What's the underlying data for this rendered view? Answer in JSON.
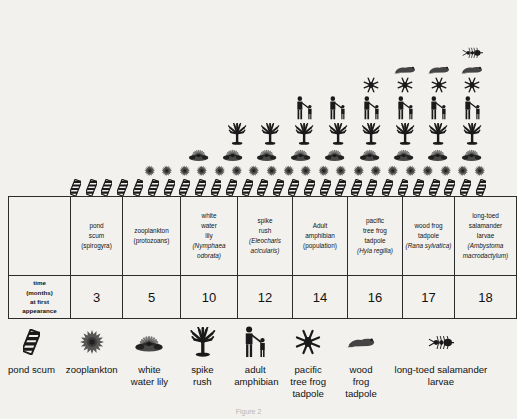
{
  "figure": {
    "caption": "Figure 2",
    "background_color": "#f2f1ee",
    "ink_color": "#1a1a1a"
  },
  "table": {
    "row_label": {
      "line1": "time",
      "line2": "(months)",
      "line3": "at first",
      "line4": "appearance"
    },
    "columns": [
      {
        "key": "pond-scum",
        "common_lines": [
          "pond",
          "scum"
        ],
        "scientific": "(spirogyra)",
        "scientific_italic": false,
        "time_months": "3",
        "icon": "pond-scum-icon",
        "count": 27,
        "legend_label": "pond scum"
      },
      {
        "key": "zooplankton",
        "common_lines": [
          "zooplankton"
        ],
        "scientific": "(protozoans)",
        "scientific_italic": false,
        "time_months": "5",
        "icon": "zooplankton-icon",
        "count": 20,
        "legend_label": "zooplankton"
      },
      {
        "key": "white-water-lily",
        "common_lines": [
          "white",
          "water",
          "lily"
        ],
        "scientific": "(Nymphaea odorata)",
        "scientific_italic": true,
        "time_months": "10",
        "icon": "water-lily-icon",
        "count": 9,
        "legend_label": "white water lily"
      },
      {
        "key": "spike-rush",
        "common_lines": [
          "spike",
          "rush"
        ],
        "scientific": "(Eleocharis acicularis)",
        "scientific_italic": true,
        "time_months": "12",
        "icon": "spike-rush-icon",
        "count": 8,
        "legend_label": "spike rush"
      },
      {
        "key": "adult-amphibian",
        "common_lines": [
          "Adult",
          "amphibian"
        ],
        "scientific": "(population)",
        "scientific_italic": false,
        "time_months": "14",
        "icon": "adult-amphibian-icon",
        "count": 6,
        "legend_label": "adult amphibian"
      },
      {
        "key": "pacific-tree-frog-tadpole",
        "common_lines": [
          "pacific",
          "tree frog",
          "tadpole"
        ],
        "scientific": "(Hyla regilla)",
        "scientific_italic": true,
        "time_months": "16",
        "icon": "pacific-tree-frog-tadpole-icon",
        "count": 4,
        "legend_label": "pacific tree frog tadpole"
      },
      {
        "key": "wood-frog-tadpole",
        "common_lines": [
          "wood frog",
          "tadpole"
        ],
        "scientific": "(Rana sylvatica)",
        "scientific_italic": true,
        "time_months": "17",
        "icon": "wood-frog-tadpole-icon",
        "count": 3,
        "legend_label": "wood frog tadpole"
      },
      {
        "key": "long-toed-salamander-larvae",
        "common_lines": [
          "long-toed",
          "salamander",
          "larvae"
        ],
        "scientific": "(Ambystoma macrodactylum)",
        "scientific_italic": true,
        "time_months": "18",
        "icon": "salamander-larvae-icon",
        "count": 1,
        "legend_label": "long-toed salamander larvae"
      }
    ]
  },
  "chart_data": {
    "type": "bar",
    "title": "",
    "subtitle": "",
    "xlabel": "",
    "ylabel": "time (months) at first appearance",
    "categories": [
      "pond scum (spirogyra)",
      "zooplankton (protozoans)",
      "white water lily (Nymphaea odorata)",
      "spike rush (Eleocharis acicularis)",
      "Adult amphibian (population)",
      "pacific tree frog tadpole (Hyla regilla)",
      "wood frog tadpole (Rana sylvatica)",
      "long-toed salamander larvae (Ambystoma macrodactylum)"
    ],
    "values": [
      3,
      5,
      10,
      12,
      14,
      16,
      17,
      18
    ],
    "pictograph_counts": [
      27,
      20,
      9,
      8,
      6,
      4,
      3,
      1
    ],
    "ylim": [
      0,
      20
    ],
    "grid": false,
    "legend_position": "bottom"
  }
}
